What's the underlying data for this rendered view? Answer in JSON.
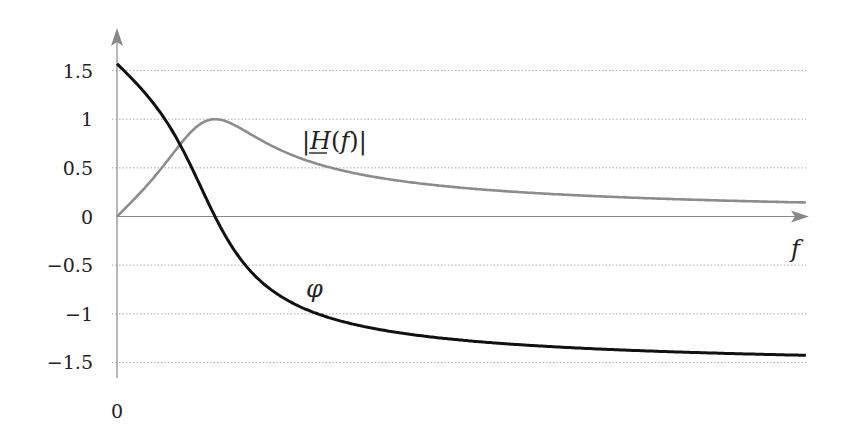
{
  "chart_data": {
    "type": "line",
    "title": "",
    "xlabel": "f",
    "ylabel": "",
    "x_origin_label": "0",
    "yticks": [
      1.5,
      1,
      0.5,
      0,
      -0.5,
      -1,
      -1.5
    ],
    "ytick_labels": [
      "1.5",
      "1",
      "0.5",
      "0",
      "−0.5",
      "−1",
      "−1.5"
    ],
    "ylim": [
      -1.6,
      1.8
    ],
    "xlim_normalized": [
      0,
      7.03
    ],
    "grid": "horizontal-dotted",
    "model_note": "u = f/f0 (resonance at u=1), Q = 1",
    "series": [
      {
        "name": "|H(f)|",
        "label": "|H(f)|",
        "color": "#8c8c8c",
        "x": [
          0,
          0.25,
          0.5,
          0.75,
          1.0,
          1.5,
          2.0,
          2.07,
          3.0,
          4.0,
          5.0,
          6.0,
          7.03
        ],
        "values": [
          0,
          0.243,
          0.555,
          0.864,
          1.0,
          0.768,
          0.555,
          0.53,
          0.351,
          0.258,
          0.204,
          0.169,
          0.144
        ]
      },
      {
        "name": "phi",
        "label": "φ",
        "color": "#111111",
        "x": [
          0,
          0.25,
          0.5,
          0.75,
          1.0,
          1.5,
          2.0,
          2.07,
          3.0,
          4.0,
          5.0,
          6.0,
          7.03
        ],
        "values": [
          1.571,
          1.326,
          0.983,
          0.523,
          0,
          -0.695,
          -0.983,
          -1.0,
          -1.212,
          -1.31,
          -1.366,
          -1.403,
          -1.427
        ]
      }
    ],
    "annotations": [
      {
        "text": "|H(f)|",
        "near": "magnitude curve, right of peak"
      },
      {
        "text": "φ",
        "near": "phase curve, below zero crossing"
      }
    ]
  },
  "labels": {
    "magnitude_bar_open": "|",
    "magnitude_H": "H",
    "magnitude_f_paren": "(f)",
    "magnitude_bar_close": "|",
    "phi": "φ",
    "x_axis": "f",
    "origin": "0"
  }
}
